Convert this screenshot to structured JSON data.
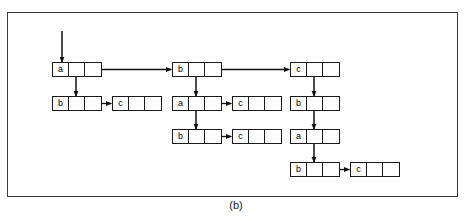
{
  "figure": {
    "caption": "(b)",
    "border_color": "#3a3a3a",
    "ink_color": "#1a1a1a",
    "background": "#ffffff"
  },
  "diagram": {
    "type": "linked-list-trie",
    "nodes": [
      {
        "id": "n1",
        "label": "a",
        "x": 52,
        "y": 62,
        "kind": "three-field",
        "column": 1,
        "row": 1
      },
      {
        "id": "n2",
        "label": "b",
        "x": 52,
        "y": 96,
        "kind": "three-field",
        "column": 1,
        "row": 2
      },
      {
        "id": "n3",
        "label": "c",
        "x": 112,
        "y": 96,
        "kind": "terminal",
        "column": 1,
        "row": 2
      },
      {
        "id": "n4",
        "label": "b",
        "x": 172,
        "y": 62,
        "kind": "three-field",
        "column": 2,
        "row": 1
      },
      {
        "id": "n5",
        "label": "a",
        "x": 172,
        "y": 96,
        "kind": "three-field",
        "column": 2,
        "row": 2
      },
      {
        "id": "n6",
        "label": "c",
        "x": 232,
        "y": 96,
        "kind": "terminal",
        "column": 2,
        "row": 2
      },
      {
        "id": "n7",
        "label": "b",
        "x": 172,
        "y": 129,
        "kind": "three-field",
        "column": 2,
        "row": 3
      },
      {
        "id": "n8",
        "label": "c",
        "x": 232,
        "y": 129,
        "kind": "terminal",
        "column": 2,
        "row": 3
      },
      {
        "id": "n9",
        "label": "c",
        "x": 290,
        "y": 62,
        "kind": "three-field",
        "column": 3,
        "row": 1
      },
      {
        "id": "n10",
        "label": "b",
        "x": 290,
        "y": 96,
        "kind": "three-field",
        "column": 3,
        "row": 2
      },
      {
        "id": "n11",
        "label": "a",
        "x": 290,
        "y": 129,
        "kind": "three-field",
        "column": 3,
        "row": 3
      },
      {
        "id": "n12",
        "label": "b",
        "x": 290,
        "y": 162,
        "kind": "three-field",
        "column": 3,
        "row": 4
      },
      {
        "id": "n13",
        "label": "c",
        "x": 350,
        "y": 162,
        "kind": "terminal",
        "column": 3,
        "row": 4
      }
    ],
    "edges": [
      {
        "from": "entry",
        "to": "n1",
        "kind": "entry-arrow",
        "orientation": "vertical"
      },
      {
        "from": "n1",
        "to": "n4",
        "kind": "next-pointer",
        "orientation": "horizontal"
      },
      {
        "from": "n4",
        "to": "n9",
        "kind": "next-pointer",
        "orientation": "horizontal"
      },
      {
        "from": "n1",
        "to": "n2",
        "kind": "down-pointer",
        "orientation": "vertical"
      },
      {
        "from": "n2",
        "to": "n3",
        "kind": "next-pointer",
        "orientation": "horizontal"
      },
      {
        "from": "n4",
        "to": "n5",
        "kind": "down-pointer",
        "orientation": "vertical"
      },
      {
        "from": "n5",
        "to": "n6",
        "kind": "next-pointer",
        "orientation": "horizontal"
      },
      {
        "from": "n5",
        "to": "n7",
        "kind": "down-pointer",
        "orientation": "vertical"
      },
      {
        "from": "n7",
        "to": "n8",
        "kind": "next-pointer",
        "orientation": "horizontal"
      },
      {
        "from": "n9",
        "to": "n10",
        "kind": "down-pointer",
        "orientation": "vertical"
      },
      {
        "from": "n10",
        "to": "n11",
        "kind": "down-pointer",
        "orientation": "vertical"
      },
      {
        "from": "n11",
        "to": "n12",
        "kind": "down-pointer",
        "orientation": "vertical"
      },
      {
        "from": "n12",
        "to": "n13",
        "kind": "next-pointer",
        "orientation": "horizontal"
      }
    ]
  }
}
